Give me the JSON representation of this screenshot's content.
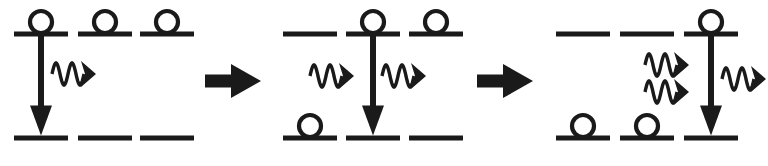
{
  "figure": {
    "background_color": "#ffffff",
    "ink_color": "#1a1a1a",
    "level_count_per_panel": 3,
    "bar_width": 54,
    "bar_thickness": 5,
    "circle_diameter": 22,
    "upper_level_y": 34,
    "lower_level_y": 138,
    "panels": [
      {
        "id": "panel-1",
        "index": 1,
        "label": "initial state",
        "x_origin": 0,
        "columns": [
          {
            "id": "p1c1",
            "x": 14,
            "upper_occupied": true,
            "lower_occupied": false,
            "transition_arrow": true,
            "arrow_x": 41
          },
          {
            "id": "p1c2",
            "x": 78,
            "upper_occupied": true,
            "lower_occupied": false,
            "transition_arrow": false,
            "arrow_x": 104
          },
          {
            "id": "p1c3",
            "x": 140,
            "upper_occupied": true,
            "lower_occupied": false,
            "transition_arrow": false,
            "arrow_x": 166
          }
        ],
        "photons": [
          {
            "id": "p1-photon-1",
            "x_start": 52,
            "y": 74,
            "length": 44,
            "direction": "right",
            "cycles": 2
          }
        ],
        "photon_count": 1,
        "occupied_upper": 3,
        "occupied_lower": 0
      },
      {
        "id": "panel-2",
        "index": 2,
        "label": "after first emission",
        "x_origin": 270,
        "columns": [
          {
            "id": "p2c1",
            "x": 283,
            "upper_occupied": false,
            "lower_occupied": true,
            "transition_arrow": false,
            "arrow_x": 310
          },
          {
            "id": "p2c2",
            "x": 346,
            "upper_occupied": true,
            "lower_occupied": false,
            "transition_arrow": true,
            "arrow_x": 373
          },
          {
            "id": "p2c3",
            "x": 409,
            "upper_occupied": true,
            "lower_occupied": false,
            "transition_arrow": false,
            "arrow_x": 436
          }
        ],
        "photons": [
          {
            "id": "p2-photon-1",
            "x_start": 310,
            "y": 76,
            "length": 44,
            "direction": "right",
            "cycles": 2
          },
          {
            "id": "p2-photon-2",
            "x_start": 382,
            "y": 76,
            "length": 44,
            "direction": "right",
            "cycles": 2
          }
        ],
        "photon_count": 2,
        "occupied_upper": 2,
        "occupied_lower": 1
      },
      {
        "id": "panel-3",
        "index": 3,
        "label": "after second emission",
        "x_origin": 540,
        "columns": [
          {
            "id": "p3c1",
            "x": 556,
            "upper_occupied": false,
            "lower_occupied": true,
            "transition_arrow": false,
            "arrow_x": 583
          },
          {
            "id": "p3c2",
            "x": 620,
            "upper_occupied": false,
            "lower_occupied": true,
            "transition_arrow": false,
            "arrow_x": 647
          },
          {
            "id": "p3c3",
            "x": 684,
            "upper_occupied": true,
            "lower_occupied": false,
            "transition_arrow": true,
            "arrow_x": 711
          }
        ],
        "photons": [
          {
            "id": "p3-photon-1",
            "x_start": 645,
            "y": 65,
            "length": 44,
            "direction": "right",
            "cycles": 2
          },
          {
            "id": "p3-photon-2",
            "x_start": 645,
            "y": 92,
            "length": 44,
            "direction": "right",
            "cycles": 2
          },
          {
            "id": "p3-photon-3",
            "x_start": 722,
            "y": 79,
            "length": 44,
            "direction": "right",
            "cycles": 2
          }
        ],
        "photon_count": 3,
        "occupied_upper": 1,
        "occupied_lower": 2
      }
    ],
    "step_arrows": [
      {
        "id": "step-arrow-1",
        "x": 205,
        "y": 81,
        "length": 56,
        "direction": "right"
      },
      {
        "id": "step-arrow-2",
        "x": 477,
        "y": 81,
        "length": 56,
        "direction": "right"
      }
    ]
  }
}
